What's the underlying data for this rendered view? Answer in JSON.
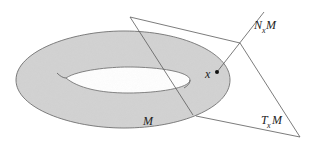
{
  "diagram": {
    "type": "manifold-tangent-normal-space",
    "labels": {
      "manifold": "M",
      "point": "x",
      "normal_space": {
        "main": "N",
        "sub": "x",
        "tail": "M"
      },
      "tangent_space": {
        "main": "T",
        "sub": "x",
        "tail": "M"
      }
    },
    "colors": {
      "surface_fill": "#cfcfcf",
      "stroke": "#555555",
      "background": "#ffffff",
      "point": "#111111"
    }
  }
}
